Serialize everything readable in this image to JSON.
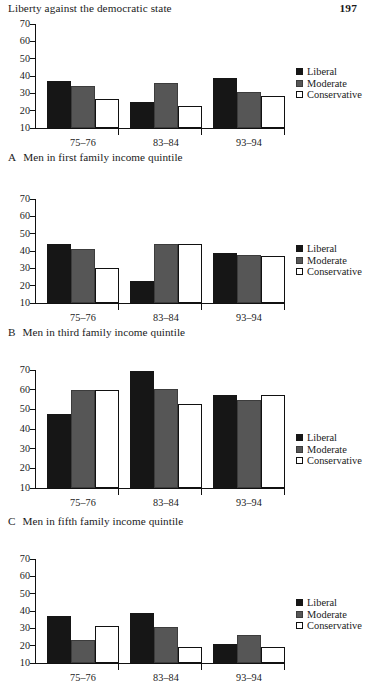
{
  "page": {
    "running_head": "Liberty against the democratic state",
    "folio": "197"
  },
  "legend_labels": {
    "liberal": "Liberal",
    "moderate": "Moderate",
    "conservative": "Conservative"
  },
  "captions": {
    "a_letter": "A",
    "a_text": "Men in first family income quintile",
    "b_letter": "B",
    "b_text": "Men in third family income quintile",
    "c_letter": "C",
    "c_text": "Men in fifth family income quintile"
  },
  "axis": {
    "yticks": [
      "70",
      "60",
      "50",
      "40",
      "30",
      "20",
      "10"
    ],
    "categories": [
      "75–76",
      "83–84",
      "93–94"
    ]
  },
  "chart_data": [
    {
      "id": "A",
      "type": "bar",
      "title": "A  Men in first family income quintile",
      "categories": [
        "75–76",
        "83–84",
        "93–94"
      ],
      "series": [
        {
          "name": "Liberal",
          "values": [
            37,
            25,
            39
          ],
          "color": "#161616"
        },
        {
          "name": "Moderate",
          "values": [
            34,
            36,
            30.5
          ],
          "color": "#565656"
        },
        {
          "name": "Conservative",
          "values": [
            27,
            22.5,
            28.5
          ],
          "color": "#ffffff"
        }
      ],
      "xlabel": "",
      "ylabel": "",
      "ylim": [
        10,
        70
      ],
      "ytick_step": 10,
      "grid": false,
      "legend_position": "right"
    },
    {
      "id": "B",
      "type": "bar",
      "title": "B  Men in third family income quintile",
      "categories": [
        "75–76",
        "83–84",
        "93–94"
      ],
      "series": [
        {
          "name": "Liberal",
          "values": [
            44,
            22.5,
            39
          ],
          "color": "#161616"
        },
        {
          "name": "Moderate",
          "values": [
            41,
            44,
            37.5
          ],
          "color": "#565656"
        },
        {
          "name": "Conservative",
          "values": [
            30,
            44,
            37
          ],
          "color": "#ffffff"
        }
      ],
      "xlabel": "",
      "ylabel": "",
      "ylim": [
        10,
        70
      ],
      "ytick_step": 10,
      "grid": false,
      "legend_position": "right"
    },
    {
      "id": "C",
      "type": "bar",
      "title": "C  Men in fifth family income quintile",
      "categories": [
        "75–76",
        "83–84",
        "93–94"
      ],
      "series": [
        {
          "name": "Liberal",
          "values": [
            47.5,
            69.5,
            57.5
          ],
          "color": "#161616"
        },
        {
          "name": "Moderate",
          "values": [
            60,
            60.5,
            55
          ],
          "color": "#565656"
        },
        {
          "name": "Conservative",
          "values": [
            60,
            52.5,
            57.5
          ],
          "color": "#ffffff"
        }
      ],
      "xlabel": "",
      "ylabel": "",
      "ylim": [
        10,
        70
      ],
      "ytick_step": 10,
      "grid": false,
      "legend_position": "right"
    },
    {
      "id": "D",
      "type": "bar",
      "title": "",
      "categories": [
        "75–76",
        "83–84",
        "93–94"
      ],
      "series": [
        {
          "name": "Liberal",
          "values": [
            37,
            39,
            21
          ],
          "color": "#161616"
        },
        {
          "name": "Moderate",
          "values": [
            23,
            31,
            26
          ],
          "color": "#565656"
        },
        {
          "name": "Conservative",
          "values": [
            31.5,
            19.5,
            19
          ],
          "color": "#ffffff"
        }
      ],
      "xlabel": "",
      "ylabel": "",
      "ylim": [
        10,
        70
      ],
      "ytick_step": 10,
      "grid": false,
      "legend_position": "right"
    }
  ]
}
